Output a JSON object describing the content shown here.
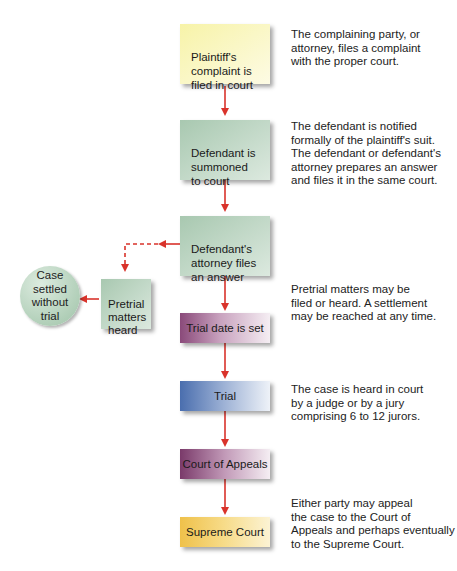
{
  "steps": [
    {
      "label": "Plaintiff's\ncomplaint is\nfiled in court",
      "description": "The complaining party, or\nattorney, files a complaint\nwith the proper court."
    },
    {
      "label": "Defendant is\nsummoned\nto court",
      "description": "The defendant is notified\nformally of the plaintiff's suit.\nThe defendant or defendant's\nattorney prepares an answer\nand files it in the same court."
    },
    {
      "label": "Defendant's\nattorney files\nan answer",
      "description": "Pretrial matters may be\nfiled or heard. A settlement\nmay be reached at any time."
    },
    {
      "label": "Trial date is set"
    },
    {
      "label": "Trial",
      "description": "The case is heard in court\nby a judge or by a jury\ncomprising 6 to 12 jurors."
    },
    {
      "label": "Court of Appeals",
      "description": "Either party may appeal\nthe case to the Court of\nAppeals and perhaps eventually\nto the Supreme Court."
    },
    {
      "label": "Supreme Court"
    }
  ],
  "side": {
    "pretrial": "Pretrial\nmatters\nheard",
    "settled": "Case\nsettled\nwithout\ntrial"
  },
  "colors": {
    "arrow": "#d9332b"
  }
}
